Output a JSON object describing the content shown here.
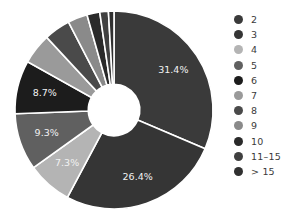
{
  "chart_data": {
    "type": "pie",
    "variant": "donut",
    "title": "",
    "subtitle": "",
    "xlabel": "",
    "ylabel": "",
    "grid": false,
    "legend_position": "right",
    "donut_hole_ratio": 0.26,
    "start_angle_deg": -90,
    "direction": "clockwise",
    "wedge_edge_color": "#ffffff",
    "background_color": "#ffffff",
    "categories": [
      "2",
      "3",
      "4",
      "5",
      "6",
      "7",
      "8",
      "9",
      "10",
      "11–15",
      "> 15"
    ],
    "values": [
      31.4,
      26.4,
      7.3,
      9.3,
      8.7,
      5.0,
      4.3,
      3.2,
      2.1,
      1.4,
      0.9
    ],
    "value_unit": "%",
    "labeled_slices": [
      {
        "category": "2",
        "label": "31.4%",
        "value": 31.4
      },
      {
        "category": "3",
        "label": "26.4%",
        "value": 26.4
      },
      {
        "category": "4",
        "label": "7.3%",
        "value": 7.3
      },
      {
        "category": "5",
        "label": "9.3%",
        "value": 9.3
      },
      {
        "category": "6",
        "label": "8.7%",
        "value": 8.7
      }
    ],
    "colors": [
      "#3a3a3a",
      "#353535",
      "#b4b4b4",
      "#606060",
      "#1c1c1c",
      "#9a9a9a",
      "#4a4a4a",
      "#8a8a8a",
      "#2a2a2a",
      "#404040",
      "#303030"
    ]
  },
  "legend": {
    "items": [
      {
        "label": "2",
        "color": "#3a3a3a"
      },
      {
        "label": "3",
        "color": "#353535"
      },
      {
        "label": "4",
        "color": "#b4b4b4"
      },
      {
        "label": "5",
        "color": "#606060"
      },
      {
        "label": "6",
        "color": "#1c1c1c"
      },
      {
        "label": "7",
        "color": "#9a9a9a"
      },
      {
        "label": "8",
        "color": "#4a4a4a"
      },
      {
        "label": "9",
        "color": "#8a8a8a"
      },
      {
        "label": "10",
        "color": "#2a2a2a"
      },
      {
        "label": "11–15",
        "color": "#404040"
      },
      {
        "label": "> 15",
        "color": "#303030"
      }
    ]
  }
}
